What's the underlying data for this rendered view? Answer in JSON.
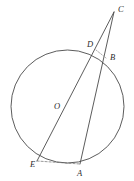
{
  "figure": {
    "width": 134,
    "height": 181,
    "background_color": "#ffffff",
    "stroke_color": "#4a4a4a",
    "label_color": "#2b2b2b"
  },
  "chart_data": {
    "type": "diagram",
    "subtype": "euclidean-geometry",
    "canvas": {
      "width": 134,
      "height": 181
    },
    "circle": {
      "name": "circle-O",
      "center": {
        "x": 67.5,
        "y": 106.5
      },
      "radius": 56.5,
      "stroke": "#4a4a4a",
      "stroke_width": 0.9,
      "fill": "none"
    },
    "points": [
      {
        "id": "C",
        "label": "C",
        "x": 114,
        "y": 12,
        "label_x": 118,
        "label_y": 5,
        "on_circle": false,
        "role": "external-point"
      },
      {
        "id": "D",
        "label": "D",
        "x": 96,
        "y": 50,
        "label_x": 87,
        "label_y": 40,
        "on_circle": true,
        "role": "secant-intersection"
      },
      {
        "id": "B",
        "label": "B",
        "x": 106,
        "y": 58,
        "label_x": 110,
        "label_y": 53,
        "on_circle": true,
        "role": "secant-intersection"
      },
      {
        "id": "O",
        "label": "O",
        "x": 67.5,
        "y": 106.5,
        "label_x": 54,
        "label_y": 102,
        "on_circle": false,
        "role": "center"
      },
      {
        "id": "E",
        "label": "E",
        "x": 37,
        "y": 161,
        "label_x": 30,
        "label_y": 160,
        "on_circle": true,
        "role": "secant-endpoint"
      },
      {
        "id": "A",
        "label": "A",
        "x": 80,
        "y": 164,
        "label_x": 77,
        "label_y": 169,
        "on_circle": true,
        "role": "secant-endpoint"
      }
    ],
    "segments": [
      {
        "id": "CE",
        "from": "C",
        "to": "E",
        "style": "solid",
        "label": "",
        "stroke": "#4a4a4a",
        "stroke_width": 0.9,
        "note": "secant through D and center O"
      },
      {
        "id": "CA",
        "from": "C",
        "to": "A",
        "style": "solid",
        "label": "",
        "stroke": "#4a4a4a",
        "stroke_width": 0.9,
        "note": "secant through B"
      },
      {
        "id": "EA",
        "from": "E",
        "to": "A",
        "style": "dashed",
        "label": "",
        "stroke": "#6e6e6e",
        "stroke_width": 0.7,
        "note": "chord EA"
      },
      {
        "id": "DB",
        "from": "D",
        "to": "B",
        "style": "dashed",
        "label": "",
        "stroke": "#8a8a8a",
        "stroke_width": 0.7,
        "note": "chord DB"
      }
    ],
    "labels": [
      "C",
      "D",
      "B",
      "O",
      "E",
      "A"
    ],
    "legend": [],
    "annotations": [],
    "grid": false
  }
}
